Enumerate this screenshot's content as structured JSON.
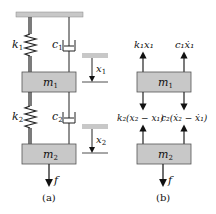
{
  "diagram": {
    "panel_a": {
      "caption": "(a)",
      "ceiling": "fixed-support",
      "spring_1_label": "k",
      "spring_1_sub": "1",
      "damper_1_label": "c",
      "damper_1_sub": "1",
      "mass_1_label": "m",
      "mass_1_sub": "1",
      "disp_1_label": "x",
      "disp_1_sub": "1",
      "spring_2_label": "k",
      "spring_2_sub": "2",
      "damper_2_label": "c",
      "damper_2_sub": "2",
      "mass_2_label": "m",
      "mass_2_sub": "2",
      "disp_2_label": "x",
      "disp_2_sub": "2",
      "force_label": "f"
    },
    "panel_b": {
      "caption": "(b)",
      "mass_1_label": "m",
      "mass_1_sub": "1",
      "mass_2_label": "m",
      "mass_2_sub": "2",
      "force_up_left_1": "k₁x₁",
      "force_up_right_1": "c₁ẋ₁",
      "force_left_2": "k₂(x₂ − x₁)",
      "force_right_2": "c₂(ẋ₂ − ẋ₁)",
      "force_label": "f"
    },
    "colors": {
      "mass_fill": "#c8c8c8",
      "ceiling_fill": "#c8c8c8",
      "line": "#222222"
    }
  }
}
